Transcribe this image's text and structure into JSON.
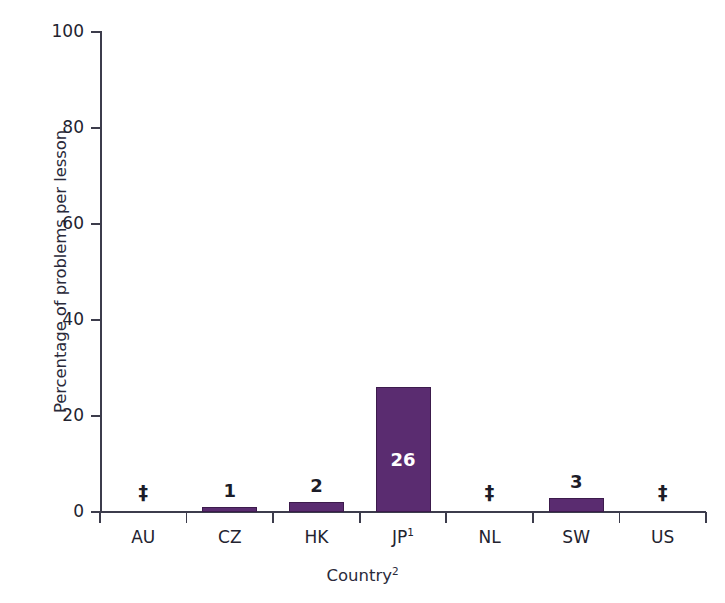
{
  "chart_data": {
    "type": "bar",
    "title": "",
    "subtitle": "",
    "xlabel": "Country",
    "xlabel_superscript": "2",
    "ylabel": "Percentage of problems per lesson",
    "categories": [
      "AU",
      "CZ",
      "HK",
      "JP",
      "NL",
      "SW",
      "US"
    ],
    "category_superscripts": [
      "",
      "",
      "",
      "1",
      "",
      "",
      ""
    ],
    "values": [
      null,
      1,
      2,
      26,
      null,
      3,
      null
    ],
    "data_labels": [
      "‡",
      "1",
      "2",
      "26",
      "‡",
      "3",
      "‡"
    ],
    "suppressed_symbol": "‡",
    "suppressed_categories": [
      "AU",
      "NL",
      "US"
    ],
    "ylim": [
      0,
      100
    ],
    "yticks": [
      0,
      20,
      40,
      60,
      80,
      100
    ],
    "ytick_labels": [
      "0",
      "20",
      "40",
      "60",
      "80",
      "100"
    ],
    "grid": false,
    "legend": false,
    "legend_position": "none",
    "bar_color": "#5a2c70",
    "bar_edge_color": "#3c1b4c",
    "axis_color": "#3c3c4c",
    "text_color": "#23232f",
    "inside_label_color": "#ffffff",
    "background_color": "#ffffff"
  }
}
